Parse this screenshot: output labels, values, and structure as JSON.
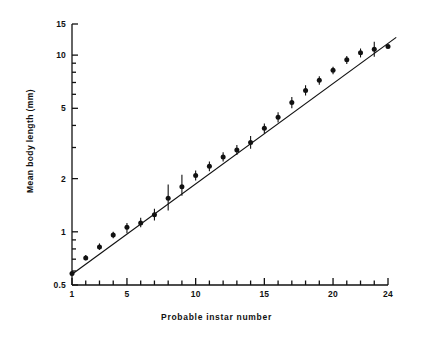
{
  "chart_data": {
    "type": "scatter",
    "title": "",
    "xlabel": "Probable instar number",
    "ylabel": "Mean body length (mm)",
    "x_scale": "linear",
    "y_scale": "log",
    "xlim": [
      1,
      24
    ],
    "ylim": [
      0.5,
      15
    ],
    "grid": false,
    "legend": "none",
    "x_ticks_major": [
      1,
      5,
      10,
      15,
      20,
      24
    ],
    "x_tick_labels": [
      "1",
      "5",
      "10",
      "15",
      "20",
      "24"
    ],
    "x_ticks_minor": [
      2,
      3,
      4,
      6,
      7,
      8,
      9,
      11,
      12,
      13,
      14,
      16,
      17,
      18,
      19,
      21,
      22,
      23
    ],
    "y_ticks_major": [
      0.5,
      1,
      2,
      5,
      10,
      15
    ],
    "y_tick_labels": [
      "0.5",
      "1",
      "2",
      "5",
      "10",
      "15"
    ],
    "y_ticks_minor": [
      0.6,
      0.7,
      0.8,
      0.9,
      3,
      4,
      6,
      7,
      8,
      9
    ],
    "x": [
      1,
      2,
      3,
      4,
      5,
      6,
      7,
      8,
      9,
      10,
      11,
      12,
      13,
      14,
      15,
      16,
      17,
      18,
      19,
      20,
      21,
      22,
      23,
      24
    ],
    "categories": [
      "1",
      "2",
      "3",
      "4",
      "5",
      "6",
      "7",
      "8",
      "9",
      "10",
      "11",
      "12",
      "13",
      "14",
      "15",
      "16",
      "17",
      "18",
      "19",
      "20",
      "21",
      "22",
      "23",
      "24"
    ],
    "values": [
      0.58,
      0.71,
      0.82,
      0.96,
      1.06,
      1.12,
      1.25,
      1.55,
      1.8,
      2.08,
      2.35,
      2.65,
      2.9,
      3.2,
      3.85,
      4.45,
      5.4,
      6.3,
      7.2,
      8.2,
      9.4,
      10.3,
      10.8,
      11.2
    ],
    "err_low": [
      0.58,
      0.69,
      0.79,
      0.92,
      0.98,
      1.06,
      1.16,
      1.32,
      1.6,
      1.95,
      2.2,
      2.5,
      2.72,
      2.95,
      3.6,
      4.15,
      5.0,
      5.9,
      6.8,
      7.8,
      8.9,
      9.7,
      9.8,
      11.2
    ],
    "err_high": [
      0.58,
      0.74,
      0.86,
      1.0,
      1.12,
      1.2,
      1.35,
      1.85,
      2.1,
      2.22,
      2.5,
      2.82,
      3.1,
      3.48,
      4.1,
      4.75,
      5.8,
      6.75,
      7.6,
      8.6,
      9.9,
      10.9,
      11.9,
      11.2
    ],
    "has_error_bar": [
      false,
      true,
      true,
      true,
      true,
      true,
      true,
      true,
      true,
      true,
      true,
      true,
      true,
      true,
      true,
      true,
      true,
      true,
      true,
      true,
      true,
      true,
      true,
      false
    ],
    "fit_line": {
      "label": "regression line",
      "x_start": 1,
      "x_end": 24.6,
      "y_start": 0.575,
      "y_end": 12.6
    },
    "annotations": [],
    "marker": "filled-circle",
    "series": [
      {
        "name": "Mean body length",
        "values": [
          0.58,
          0.71,
          0.82,
          0.96,
          1.06,
          1.12,
          1.25,
          1.55,
          1.8,
          2.08,
          2.35,
          2.65,
          2.9,
          3.2,
          3.85,
          4.45,
          5.4,
          6.3,
          7.2,
          8.2,
          9.4,
          10.3,
          10.8,
          11.2
        ]
      }
    ]
  },
  "axes": {
    "y_label_text": "Mean body length (mm)",
    "x_label_text": "Probable instar number"
  }
}
